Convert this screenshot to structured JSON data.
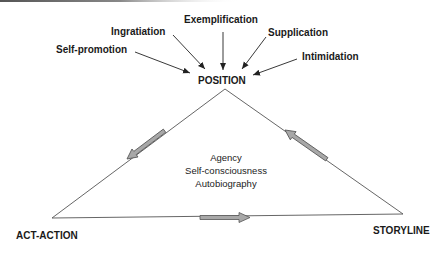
{
  "diagram": {
    "apex_label": "POSITION",
    "left_vertex_label": "ACT-ACTION",
    "right_vertex_label": "STORYLINE",
    "center_lines": [
      "Agency",
      "Self-consciousness",
      "Autobiography"
    ],
    "inputs": [
      {
        "label": "Self-promotion"
      },
      {
        "label": "Ingratiation"
      },
      {
        "label": "Exemplification"
      },
      {
        "label": "Supplication"
      },
      {
        "label": "Intimidation"
      }
    ],
    "flow_arrows": [
      {
        "from": "POSITION",
        "to": "ACT-ACTION"
      },
      {
        "from": "ACT-ACTION",
        "to": "STORYLINE"
      },
      {
        "from": "STORYLINE",
        "to": "POSITION"
      }
    ],
    "colors": {
      "line": "#555555",
      "arrow_fill": "#a8a8a8",
      "arrow_stroke": "#555555",
      "text": "#1a1a1a"
    }
  }
}
